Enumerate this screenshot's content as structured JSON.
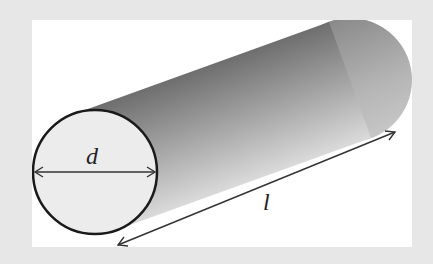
{
  "diagram": {
    "labels": {
      "diameter": "d",
      "length": "l"
    },
    "colors": {
      "background": "#e7e7e7",
      "panel": "#ffffff",
      "cap_fill": "#ececec",
      "outline": "#1a1a1a",
      "body_dark": "#6f6f6f",
      "body_light": "#d6d6d6",
      "arrow": "#333333"
    }
  }
}
